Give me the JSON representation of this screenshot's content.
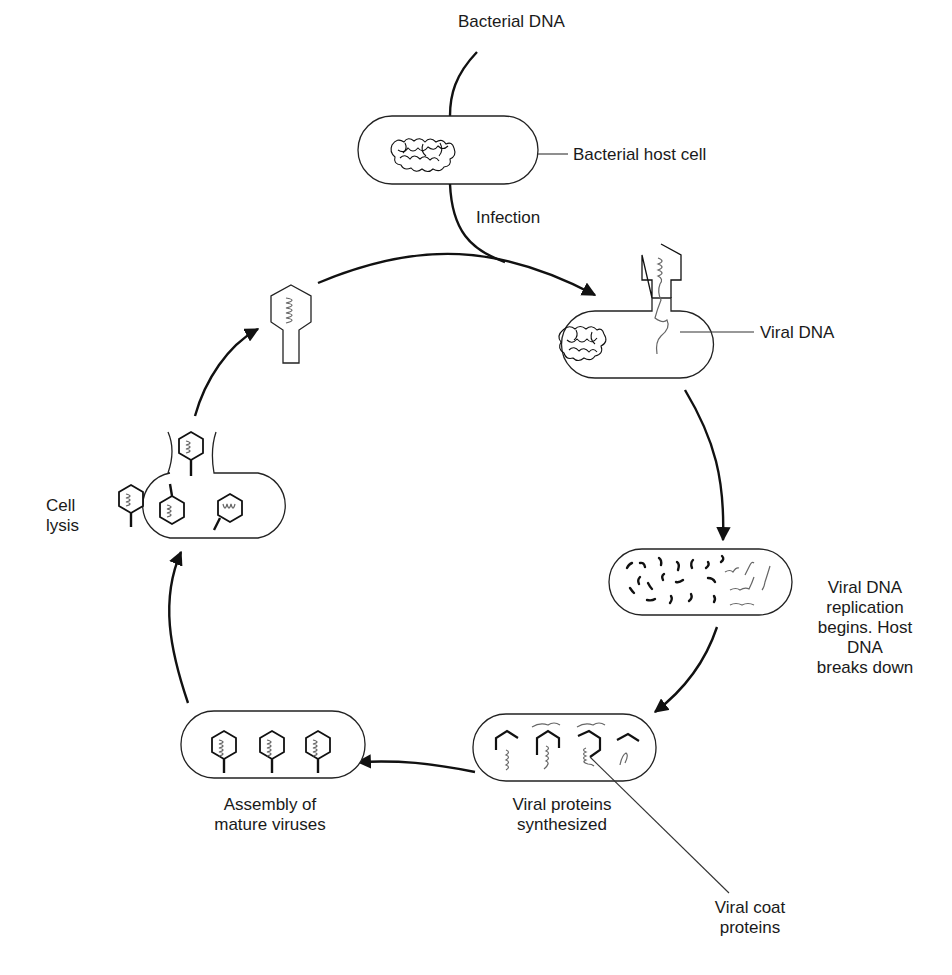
{
  "diagram": {
    "labels": {
      "bacterial_dna": "Bacterial DNA",
      "bacterial_host_cell": "Bacterial host cell",
      "infection": "Infection",
      "viral_dna": "Viral DNA",
      "replication_line1": "Viral DNA",
      "replication_line2": "replication",
      "replication_line3": "begins. Host",
      "replication_line4": "DNA",
      "replication_line5": "breaks down",
      "proteins_line1": "Viral proteins",
      "proteins_line2": "synthesized",
      "coat_line1": "Viral coat",
      "coat_line2": "proteins",
      "assembly_line1": "Assembly of",
      "assembly_line2": "mature viruses",
      "lysis_line1": "Cell",
      "lysis_line2": "lysis"
    },
    "stages": [
      {
        "id": "host-cell",
        "name": "Bacterial host cell"
      },
      {
        "id": "infection",
        "name": "Viral DNA injected"
      },
      {
        "id": "replication",
        "name": "Viral DNA replication begins. Host DNA breaks down"
      },
      {
        "id": "synthesis",
        "name": "Viral proteins synthesized"
      },
      {
        "id": "assembly",
        "name": "Assembly of mature viruses"
      },
      {
        "id": "lysis",
        "name": "Cell lysis"
      }
    ],
    "colors": {
      "ink": "#111111",
      "background": "#ffffff",
      "viral_dna": "#666666"
    }
  }
}
